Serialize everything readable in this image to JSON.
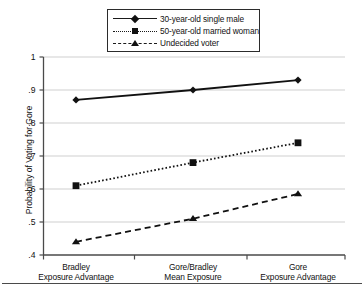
{
  "chart_data": {
    "type": "line",
    "title": "",
    "xlabel": "",
    "ylabel": "Probability of Voting for Gore",
    "categories": [
      "Bradley\nExposure Advantage",
      "Gore/Bradley\nMean Exposure",
      "Gore\nExposure Advantage"
    ],
    "category_lines": [
      [
        "Bradley",
        "Exposure Advantage"
      ],
      [
        "Gore/Bradley",
        "Mean Exposure"
      ],
      [
        "Gore",
        "Exposure Advantage"
      ]
    ],
    "series": [
      {
        "name": "30-year-old single male",
        "values": [
          0.87,
          0.9,
          0.93
        ],
        "line_style": "solid",
        "marker": "diamond",
        "color": "#111111"
      },
      {
        "name": "50-year-old married woman",
        "values": [
          0.61,
          0.68,
          0.74
        ],
        "line_style": "dotted",
        "marker": "square",
        "color": "#111111"
      },
      {
        "name": "Undecided voter",
        "values": [
          0.44,
          0.51,
          0.585
        ],
        "line_style": "dashed",
        "marker": "triangle",
        "color": "#111111"
      }
    ],
    "ylim": [
      0.4,
      1.0
    ],
    "ytick_values": [
      1,
      0.9,
      0.8,
      0.7,
      0.6,
      0.5,
      0.4
    ],
    "ytick_labels": [
      "1",
      ".9",
      ".8",
      ".7",
      ".6",
      ".5",
      ".4"
    ],
    "grid": "horizontal",
    "legend_position": "top-center",
    "axis_color": "#4a4a4a",
    "grid_color": "#c9c9c9"
  },
  "legend": {
    "entries": [
      {
        "label": "30-year-old single male"
      },
      {
        "label": "50-year-old married woman"
      },
      {
        "label": "Undecided voter"
      }
    ]
  }
}
